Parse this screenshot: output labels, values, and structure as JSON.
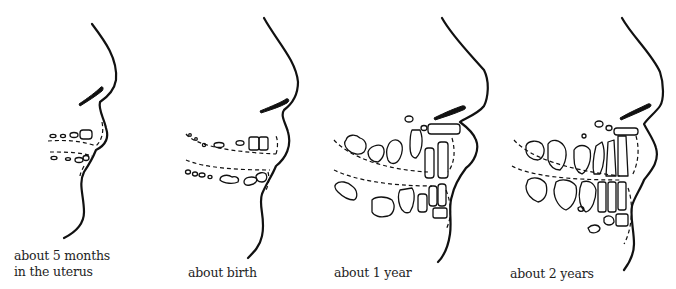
{
  "figure": {
    "panels": [
      {
        "id": "5-months",
        "caption_line1": "about 5 months",
        "caption_line2": "in the uterus"
      },
      {
        "id": "birth",
        "caption_line1": "about birth",
        "caption_line2": ""
      },
      {
        "id": "1-year",
        "caption_line1": "about 1 year",
        "caption_line2": ""
      },
      {
        "id": "2-years",
        "caption_line1": "about 2 years",
        "caption_line2": ""
      }
    ]
  }
}
